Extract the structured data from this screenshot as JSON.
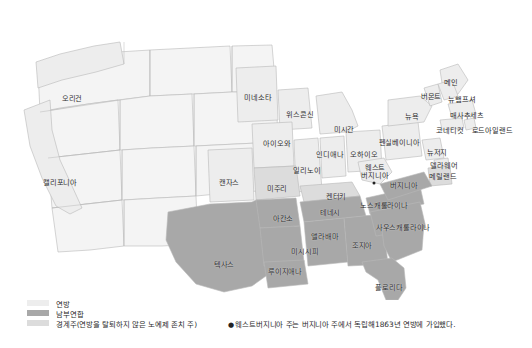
{
  "map": {
    "title_visible": false,
    "colors": {
      "union": "#ededed",
      "confederacy": "#a8a8a8",
      "border_state": "#dcdcdc",
      "territory": "#f4f4f4",
      "outline": "#b9b9b9",
      "water": "#ffffff",
      "label_text": "#2b2b2b",
      "capital_marker": "#232323"
    },
    "states": [
      {
        "name": "오리건",
        "x": 72,
        "y": 99,
        "group": "union"
      },
      {
        "name": "캘리포니아",
        "x": 60,
        "y": 183,
        "group": "union"
      },
      {
        "name": "미네소타",
        "x": 258,
        "y": 98,
        "group": "union"
      },
      {
        "name": "위스콘신",
        "x": 300,
        "y": 115,
        "group": "union"
      },
      {
        "name": "미시간",
        "x": 344,
        "y": 130,
        "group": "union"
      },
      {
        "name": "아이오와",
        "x": 277,
        "y": 144,
        "group": "union"
      },
      {
        "name": "일리노이",
        "x": 307,
        "y": 171,
        "group": "union"
      },
      {
        "name": "인디애나",
        "x": 330,
        "y": 155,
        "group": "union"
      },
      {
        "name": "오하이오",
        "x": 364,
        "y": 155,
        "group": "union"
      },
      {
        "name": "캔자스",
        "x": 229,
        "y": 183,
        "group": "union"
      },
      {
        "name": "미주리",
        "x": 277,
        "y": 189,
        "group": "border"
      },
      {
        "name": "켄터키",
        "x": 336,
        "y": 197,
        "group": "border"
      },
      {
        "name": "펜실베이니아",
        "x": 399,
        "y": 143,
        "group": "union"
      },
      {
        "name": "뉴욕",
        "x": 412,
        "y": 117,
        "group": "union"
      },
      {
        "name": "버몬트",
        "x": 431,
        "y": 97,
        "group": "union"
      },
      {
        "name": "메인",
        "x": 451,
        "y": 83,
        "group": "union"
      },
      {
        "name": "뉴햄프셔",
        "x": 462,
        "y": 100,
        "group": "union"
      },
      {
        "name": "매사추세츠",
        "x": 467,
        "y": 116,
        "group": "union"
      },
      {
        "name": "코네티컷",
        "x": 450,
        "y": 131,
        "group": "union"
      },
      {
        "name": "로드아일랜드",
        "x": 492,
        "y": 131,
        "group": "union"
      },
      {
        "name": "뉴저지",
        "x": 437,
        "y": 153,
        "group": "union"
      },
      {
        "name": "델라웨어",
        "x": 444,
        "y": 166,
        "group": "union"
      },
      {
        "name": "메릴랜드",
        "x": 443,
        "y": 177,
        "group": "border"
      },
      {
        "name": "웨스트\n버지니아",
        "x": 375,
        "y": 172,
        "group": "union",
        "two_line": true
      },
      {
        "name": "버지니아",
        "x": 404,
        "y": 186,
        "group": "confederacy"
      },
      {
        "name": "노스캐롤라이나",
        "x": 384,
        "y": 206,
        "group": "confederacy"
      },
      {
        "name": "사우스캐롤라이나",
        "x": 403,
        "y": 228,
        "group": "confederacy"
      },
      {
        "name": "테네시",
        "x": 330,
        "y": 213,
        "group": "confederacy"
      },
      {
        "name": "아칸소",
        "x": 283,
        "y": 219,
        "group": "confederacy"
      },
      {
        "name": "앨라배마",
        "x": 325,
        "y": 237,
        "group": "confederacy"
      },
      {
        "name": "조지아",
        "x": 362,
        "y": 246,
        "group": "confederacy"
      },
      {
        "name": "미시시피",
        "x": 305,
        "y": 252,
        "group": "confederacy"
      },
      {
        "name": "루이지애나",
        "x": 285,
        "y": 272,
        "group": "confederacy"
      },
      {
        "name": "텍사스",
        "x": 224,
        "y": 265,
        "group": "confederacy"
      },
      {
        "name": "플로리다",
        "x": 389,
        "y": 288,
        "group": "confederacy"
      }
    ],
    "markers": [
      {
        "name": "capital-marker",
        "x": 374,
        "y": 183
      }
    ]
  },
  "legend": {
    "items": [
      {
        "label": "연방",
        "color": "#ededed"
      },
      {
        "label": "남부연합",
        "color": "#a8a8a8"
      },
      {
        "label": "경계주(연방을 탈퇴하지 않은 노예제 존치 주)",
        "color": "#dcdcdc"
      }
    ]
  },
  "footnote": {
    "bullet": "●",
    "text": "웨스트버지니아 주는 버지니아 주에서 독립해1863년 연방에 가입했다."
  }
}
